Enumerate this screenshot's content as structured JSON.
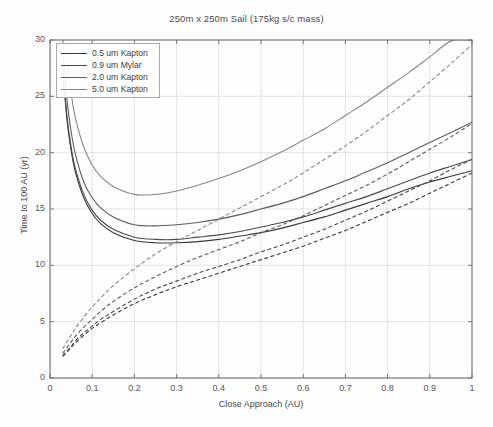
{
  "chart_data": {
    "type": "line",
    "title": "250m x 250m Sail (175kg s/c mass)",
    "xlabel": "Close Approach (AU)",
    "ylabel": "Time to 100 AU (yr)",
    "xlim": [
      0,
      1
    ],
    "ylim": [
      0,
      30
    ],
    "xticks": [
      "0",
      "0.1",
      "0.2",
      "0.3",
      "0.4",
      "0.5",
      "0.6",
      "0.7",
      "0.8",
      "0.9",
      "1"
    ],
    "yticks": [
      "0",
      "5",
      "10",
      "15",
      "20",
      "25",
      "30"
    ],
    "grid": true,
    "legend_position": "upper left",
    "legend": [
      "0.5 um Kapton",
      "0.9 um Mylar",
      "2.0 um Kapton",
      "5.0 um Kapton"
    ],
    "x": [
      0.03,
      0.04,
      0.05,
      0.06,
      0.08,
      0.1,
      0.12,
      0.15,
      0.2,
      0.25,
      0.3,
      0.35,
      0.4,
      0.45,
      0.5,
      0.55,
      0.6,
      0.65,
      0.7,
      0.75,
      0.8,
      0.85,
      0.9,
      0.95,
      1.0
    ],
    "series": [
      {
        "name": "0.5 um Kapton",
        "style": "solid",
        "color": "#3a3a3a",
        "values": [
          27.5,
          23.0,
          20.2,
          18.3,
          16.0,
          14.6,
          13.7,
          12.9,
          12.2,
          12.0,
          12.0,
          12.1,
          12.3,
          12.6,
          12.9,
          13.3,
          13.8,
          14.3,
          14.9,
          15.5,
          16.1,
          16.8,
          17.4,
          17.9,
          18.4
        ]
      },
      {
        "name": "0.5 um Kapton (no close approach)",
        "style": "dashed",
        "color": "#3a3a3a",
        "values": [
          1.9,
          2.3,
          2.7,
          3.1,
          3.8,
          4.4,
          4.9,
          5.6,
          6.6,
          7.4,
          8.1,
          8.7,
          9.3,
          9.9,
          10.5,
          11.1,
          11.7,
          12.4,
          13.1,
          13.9,
          14.7,
          15.5,
          16.4,
          17.3,
          18.2
        ]
      },
      {
        "name": "0.9 um Mylar",
        "style": "solid",
        "color": "#4a4a4a",
        "values": [
          27.8,
          23.3,
          20.5,
          18.6,
          16.3,
          14.9,
          14.0,
          13.2,
          12.5,
          12.3,
          12.3,
          12.5,
          12.7,
          13.0,
          13.4,
          13.8,
          14.3,
          14.9,
          15.5,
          16.1,
          16.8,
          17.5,
          18.2,
          18.8,
          19.4
        ]
      },
      {
        "name": "0.9 um Mylar (no close approach)",
        "style": "dashed",
        "color": "#4a4a4a",
        "values": [
          2.0,
          2.4,
          2.8,
          3.3,
          4.0,
          4.6,
          5.2,
          5.9,
          7.0,
          7.9,
          8.6,
          9.3,
          9.9,
          10.5,
          11.2,
          11.8,
          12.5,
          13.2,
          14.0,
          14.8,
          15.7,
          16.6,
          17.5,
          18.5,
          19.4
        ]
      },
      {
        "name": "2.0 um Kapton",
        "style": "solid",
        "color": "#5c5c5c",
        "values": [
          29.5,
          24.8,
          21.9,
          19.9,
          17.4,
          16.0,
          15.1,
          14.3,
          13.6,
          13.5,
          13.6,
          13.8,
          14.1,
          14.5,
          15.0,
          15.5,
          16.1,
          16.8,
          17.5,
          18.3,
          19.1,
          20.0,
          20.9,
          21.8,
          22.7
        ]
      },
      {
        "name": "2.0 um Kapton (no close approach)",
        "style": "dashed",
        "color": "#5c5c5c",
        "values": [
          2.2,
          2.7,
          3.2,
          3.7,
          4.5,
          5.2,
          5.9,
          6.8,
          8.0,
          9.0,
          9.9,
          10.7,
          11.4,
          12.1,
          12.9,
          13.6,
          14.4,
          15.3,
          16.2,
          17.1,
          18.1,
          19.2,
          20.3,
          21.4,
          22.6
        ]
      },
      {
        "name": "5.0 um Kapton",
        "style": "solid",
        "color": "#878787",
        "values": [
          30.0,
          28.2,
          25.3,
          23.1,
          20.5,
          18.9,
          17.9,
          17.0,
          16.3,
          16.3,
          16.6,
          17.1,
          17.7,
          18.4,
          19.2,
          20.1,
          21.1,
          22.1,
          23.3,
          24.5,
          25.8,
          27.1,
          28.5,
          29.9,
          30.0
        ]
      },
      {
        "name": "5.0 um Kapton (no close approach)",
        "style": "dashed",
        "color": "#878787",
        "values": [
          2.6,
          3.2,
          3.8,
          4.4,
          5.4,
          6.3,
          7.1,
          8.2,
          9.7,
          11.0,
          12.1,
          13.1,
          14.1,
          15.1,
          16.1,
          17.1,
          18.2,
          19.4,
          20.6,
          21.9,
          23.3,
          24.7,
          26.3,
          27.9,
          29.6
        ]
      }
    ]
  }
}
